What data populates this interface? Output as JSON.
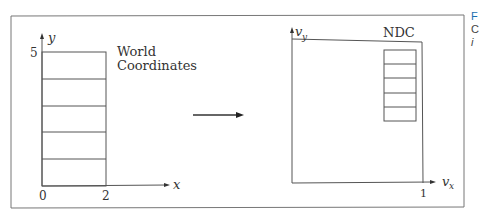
{
  "world": {
    "y_axis_label": "y",
    "x_axis_label": "x",
    "y_tick": "5",
    "x_tick": "2",
    "origin": "0",
    "title_line1": "World",
    "title_line2": "Coordinates"
  },
  "ndc": {
    "title": "NDC",
    "y_axis_label": "v",
    "y_axis_sub": "y",
    "x_axis_label": "v",
    "x_axis_sub": "x",
    "x_tick": "1"
  },
  "caption_fragment": {
    "line1": "F",
    "line2": "C",
    "line3": "i"
  },
  "colors": {
    "line": "#555555",
    "caption": "#1a6fb0"
  }
}
